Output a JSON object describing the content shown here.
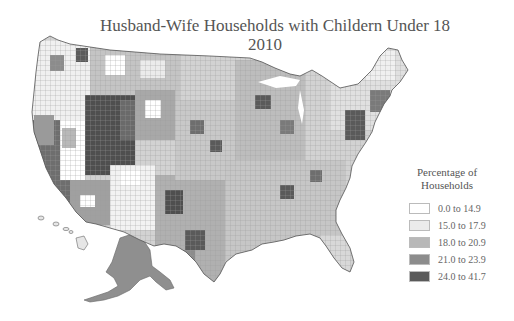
{
  "title": {
    "line1": "Husband-Wife Households with Childern Under 18",
    "line2": "2010"
  },
  "legend": {
    "title_line1": "Percentage of",
    "title_line2": "Households",
    "items": [
      {
        "label": "0.0 to 14.9",
        "color": "#ffffff"
      },
      {
        "label": "15.0 to 17.9",
        "color": "#ebebeb"
      },
      {
        "label": "18.0 to 20.9",
        "color": "#b8b8b8"
      },
      {
        "label": "21.0 to 23.9",
        "color": "#8c8c8c"
      },
      {
        "label": "24.0 to 41.7",
        "color": "#5a5a5a"
      }
    ]
  },
  "map": {
    "region": "United States (counties, including Alaska and Hawaii insets)",
    "border_color": "#666666"
  }
}
